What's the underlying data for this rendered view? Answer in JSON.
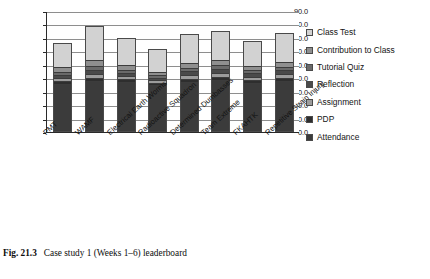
{
  "caption": {
    "figure_number": "Fig. 21.3",
    "text": "Case study 1 (Weeks 1–6) leaderboard"
  },
  "legend": {
    "position": "right",
    "entries": [
      {
        "label": "Class Test",
        "color": "#d2d2d2"
      },
      {
        "label": "Contribution to Class",
        "color": "#8f8f8f"
      },
      {
        "label": "Tutorial Quiz",
        "color": "#6a6a6a"
      },
      {
        "label": "Reflection",
        "color": "#4a4a4a"
      },
      {
        "label": "Assignment",
        "color": "#9c9c9c"
      },
      {
        "label": "PDP",
        "color": "#2e2e2e"
      },
      {
        "label": "Attendance",
        "color": "#3b3b3b"
      }
    ]
  },
  "axis": {
    "y_ticks": [
      "0.0",
      "10.0",
      "20.0",
      "30.0",
      "40.0",
      "50.0",
      "60.0",
      "70.0",
      "80.0",
      "90.0"
    ]
  },
  "chart_data": {
    "type": "bar",
    "stacked": true,
    "title": "",
    "xlabel": "",
    "ylabel": "",
    "ylim": [
      0,
      90
    ],
    "ytick_step": 10,
    "grid": true,
    "legend_position": "right",
    "categories": [
      "PMT",
      "WAMF",
      "Electrical Earth Worms",
      "Radioactive Squadron",
      "Determined Dumbasses",
      "Team Extreme",
      "FKAHTK",
      "Repetitive Strain Injury"
    ],
    "series": [
      {
        "name": "Attendance",
        "color": "#3b3b3b",
        "values": [
          35.0,
          37.0,
          36.5,
          34.0,
          36.5,
          38.0,
          36.0,
          37.0
        ]
      },
      {
        "name": "PDP",
        "color": "#2e2e2e",
        "values": [
          2.0,
          2.5,
          2.0,
          2.0,
          2.5,
          2.5,
          2.0,
          2.5
        ]
      },
      {
        "name": "Assignment",
        "color": "#9c9c9c",
        "values": [
          2.5,
          3.0,
          2.5,
          2.0,
          3.0,
          3.0,
          2.5,
          3.0
        ]
      },
      {
        "name": "Reflection",
        "color": "#4a4a4a",
        "values": [
          2.5,
          3.0,
          2.5,
          2.0,
          2.5,
          3.0,
          2.5,
          3.0
        ]
      },
      {
        "name": "Tutorial Quiz",
        "color": "#6a6a6a",
        "values": [
          2.5,
          3.0,
          2.5,
          2.0,
          2.5,
          3.0,
          2.5,
          2.5
        ]
      },
      {
        "name": "Contribution to Class",
        "color": "#8f8f8f",
        "values": [
          3.5,
          4.5,
          3.5,
          2.5,
          4.0,
          4.0,
          3.5,
          4.0
        ]
      },
      {
        "name": "Class Test",
        "color": "#d2d2d2",
        "values": [
          18.0,
          26.0,
          20.5,
          17.5,
          22.0,
          21.5,
          19.0,
          22.0
        ]
      }
    ],
    "totals": [
      66.0,
      79.0,
      70.0,
      62.0,
      73.0,
      75.0,
      68.0,
      74.0
    ]
  }
}
